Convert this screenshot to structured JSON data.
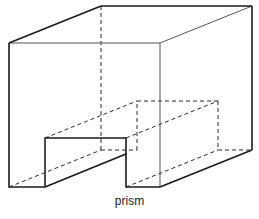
{
  "diagram": {
    "label": "prism",
    "stroke_color": "#1a1a1a",
    "thin_stroke_color": "#555555",
    "depth_offset": [
      92,
      -37
    ],
    "front_face": {
      "left": 9,
      "right": 160,
      "top": 43,
      "bottom": 187,
      "notch": {
        "left": 45,
        "right": 126,
        "top": 138
      }
    },
    "back_face": {
      "left": 101,
      "right": 252,
      "top": 6,
      "bottom": 150,
      "notch": {
        "left": 137,
        "right": 218,
        "top": 101
      }
    }
  }
}
